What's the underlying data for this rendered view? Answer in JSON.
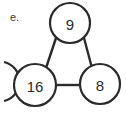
{
  "figure": {
    "item_label": "e.",
    "background_color": "#ffffff",
    "stroke_color": "#2b2b2b",
    "text_color": "#2b2b2b",
    "nodes": [
      {
        "id": "top",
        "value": "9",
        "cx": 70,
        "cy": 23,
        "r": 20
      },
      {
        "id": "bottom-left",
        "value": "16",
        "cx": 35,
        "cy": 85,
        "r": 21
      },
      {
        "id": "bottom-right",
        "value": "8",
        "cx": 100,
        "cy": 84,
        "r": 20
      }
    ],
    "edges": [
      {
        "id": "top-to-bottom-left",
        "x1": 56,
        "y1": 38,
        "x2": 46,
        "y2": 68
      },
      {
        "id": "top-to-bottom-right",
        "x1": 84,
        "y1": 38,
        "x2": 92,
        "y2": 68
      },
      {
        "id": "bottom-left-to-bottom-right",
        "x1": 56,
        "y1": 85,
        "x2": 80,
        "y2": 85
      }
    ],
    "partial_arc": {
      "id": "cropped-neighbor-circle",
      "path": "M 4 62 A 20 20 0 0 1 4 101"
    }
  }
}
